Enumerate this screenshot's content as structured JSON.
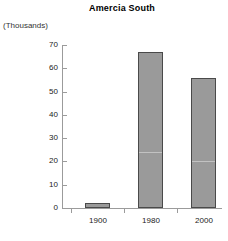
{
  "chart_data": {
    "type": "bar",
    "title": "Amercia South",
    "units_label": "(Thousands)",
    "xlabel": "",
    "ylabel": "",
    "categories": [
      "1900",
      "1980",
      "2000"
    ],
    "values": [
      2,
      67,
      56
    ],
    "series": [
      {
        "name": "Amercia South",
        "values": [
          2,
          67,
          56
        ]
      }
    ],
    "ylim": [
      0,
      70
    ],
    "ytick_values": [
      0,
      10,
      20,
      30,
      40,
      50,
      60,
      70
    ],
    "ytick_labels": [
      "0",
      "10",
      "20",
      "30",
      "40",
      "50",
      "60",
      "70"
    ],
    "grid": false,
    "legend": false,
    "legend_position": "none",
    "bar_color": "#9a9a9a",
    "bar_edge_color": "#4a4a4a",
    "axis_color": "#9b9b9b",
    "text_color": "#222222",
    "background": "#ffffff"
  }
}
